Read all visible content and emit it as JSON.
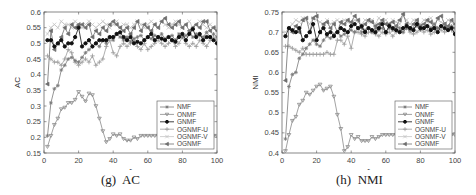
{
  "chart_data": [
    {
      "type": "line",
      "panel": "left",
      "caption": "(g)  AC",
      "title": "",
      "xlabel": "r",
      "ylabel": "AC",
      "xlim": [
        0,
        100
      ],
      "ylim": [
        0.15,
        0.6
      ],
      "xticks": [
        0,
        20,
        40,
        60,
        80,
        100
      ],
      "yticks": [
        0.15,
        0.2,
        0.25,
        0.3,
        0.35,
        0.4,
        0.45,
        0.5,
        0.55,
        0.6
      ],
      "ytick_labels": [
        "0.15",
        "0.2",
        "0.25",
        "0.3",
        "0.35",
        "0.4",
        "0.45",
        "0.5",
        "0.55",
        "0.6"
      ],
      "grid": false,
      "legend_position": "lower right",
      "x": [
        2,
        4,
        6,
        8,
        10,
        12,
        14,
        16,
        18,
        20,
        22,
        24,
        26,
        28,
        30,
        32,
        34,
        36,
        38,
        40,
        42,
        44,
        46,
        48,
        50,
        52,
        54,
        56,
        58,
        60,
        62,
        64,
        66,
        68,
        70,
        72,
        74,
        76,
        78,
        80,
        82,
        84,
        86,
        88,
        90,
        92,
        94,
        96,
        98,
        100
      ],
      "series": [
        {
          "name": "NMF",
          "color": "#7a7a7a",
          "marker": "star",
          "values": [
            0.205,
            0.31,
            0.355,
            0.365,
            0.415,
            0.43,
            0.45,
            0.455,
            0.445,
            0.44,
            0.455,
            0.47,
            0.48,
            0.49,
            0.5,
            0.49,
            0.51,
            0.5,
            0.52,
            0.51,
            0.53,
            0.52,
            0.51,
            0.52,
            0.505,
            0.515,
            0.52,
            0.525,
            0.51,
            0.52,
            0.515,
            0.525,
            0.52,
            0.53,
            0.515,
            0.52,
            0.525,
            0.51,
            0.53,
            0.52,
            0.525,
            0.535,
            0.52,
            0.53,
            0.525,
            0.52,
            0.535,
            0.52,
            0.53,
            0.52
          ]
        },
        {
          "name": "ONMF",
          "color": "#8a8a8a",
          "marker": "triangle-down",
          "values": [
            0.17,
            0.205,
            0.24,
            0.26,
            0.29,
            0.295,
            0.31,
            0.31,
            0.32,
            0.345,
            0.33,
            0.315,
            0.34,
            0.335,
            0.3,
            0.26,
            0.22,
            0.185,
            0.195,
            0.21,
            0.205,
            0.21,
            0.195,
            0.19,
            0.19,
            0.2,
            0.195,
            0.205,
            0.205,
            0.205,
            0.205,
            0.205,
            0.205,
            0.205,
            0.205,
            0.205,
            0.205,
            0.205,
            0.205,
            0.205,
            0.205,
            0.205,
            0.205,
            0.205,
            0.205,
            0.205,
            0.205,
            0.205,
            0.205,
            0.205
          ]
        },
        {
          "name": "GNMF",
          "color": "#111111",
          "marker": "circle",
          "values": [
            0.51,
            0.51,
            0.49,
            0.5,
            0.51,
            0.49,
            0.5,
            0.5,
            0.52,
            0.55,
            0.49,
            0.5,
            0.51,
            0.49,
            0.5,
            0.51,
            0.51,
            0.51,
            0.52,
            0.52,
            0.53,
            0.535,
            0.52,
            0.51,
            0.52,
            0.5,
            0.505,
            0.5,
            0.51,
            0.52,
            0.53,
            0.51,
            0.52,
            0.515,
            0.51,
            0.52,
            0.51,
            0.505,
            0.52,
            0.53,
            0.51,
            0.53,
            0.545,
            0.52,
            0.53,
            0.51,
            0.52,
            0.52,
            0.51,
            0.5
          ]
        },
        {
          "name": "OGNMF-U",
          "color": "#9a9a9a",
          "marker": "plus",
          "values": [
            0.46,
            0.45,
            0.44,
            0.44,
            0.43,
            0.45,
            0.48,
            0.47,
            0.44,
            0.43,
            0.44,
            0.45,
            0.44,
            0.46,
            0.43,
            0.44,
            0.45,
            0.49,
            0.51,
            0.47,
            0.46,
            0.49,
            0.5,
            0.49,
            0.5,
            0.51,
            0.49,
            0.48,
            0.5,
            0.48,
            0.49,
            0.5,
            0.51,
            0.5,
            0.49,
            0.5,
            0.51,
            0.49,
            0.5,
            0.52,
            0.5,
            0.49,
            0.5,
            0.49,
            0.51,
            0.5,
            0.49,
            0.51,
            0.52,
            0.51
          ]
        },
        {
          "name": "OGNMF-V",
          "color": "#c4c4c4",
          "marker": "x",
          "values": [
            0.53,
            0.55,
            0.56,
            0.55,
            0.57,
            0.56,
            0.56,
            0.55,
            0.57,
            0.56,
            0.55,
            0.56,
            0.57,
            0.56,
            0.55,
            0.56,
            0.57,
            0.56,
            0.55,
            0.56,
            0.57,
            0.55,
            0.56,
            0.56,
            0.55,
            0.56,
            0.57,
            0.56,
            0.55,
            0.56,
            0.57,
            0.56,
            0.55,
            0.57,
            0.56,
            0.55,
            0.56,
            0.57,
            0.56,
            0.55,
            0.56,
            0.57,
            0.55,
            0.56,
            0.57,
            0.56,
            0.55,
            0.56,
            0.55,
            0.55
          ]
        },
        {
          "name": "OGNMF",
          "color": "#6e6e6e",
          "marker": "triangle-left",
          "values": [
            0.37,
            0.54,
            0.48,
            0.5,
            0.52,
            0.55,
            0.53,
            0.56,
            0.55,
            0.56,
            0.56,
            0.55,
            0.56,
            0.52,
            0.54,
            0.53,
            0.55,
            0.54,
            0.56,
            0.57,
            0.56,
            0.55,
            0.54,
            0.55,
            0.53,
            0.55,
            0.57,
            0.54,
            0.56,
            0.55,
            0.54,
            0.56,
            0.55,
            0.57,
            0.58,
            0.56,
            0.55,
            0.56,
            0.57,
            0.55,
            0.56,
            0.54,
            0.55,
            0.56,
            0.55,
            0.57,
            0.57,
            0.54,
            0.55,
            0.54
          ]
        }
      ]
    },
    {
      "type": "line",
      "panel": "right",
      "caption": "(h)  NMI",
      "title": "",
      "xlabel": "r",
      "ylabel": "NMI",
      "xlim": [
        0,
        100
      ],
      "ylim": [
        0.4,
        0.75
      ],
      "xticks": [
        0,
        20,
        40,
        60,
        80,
        100
      ],
      "yticks": [
        0.4,
        0.45,
        0.5,
        0.55,
        0.6,
        0.65,
        0.7,
        0.75
      ],
      "ytick_labels": [
        "0.4",
        "0.45",
        "0.5",
        "0.55",
        "0.6",
        "0.65",
        "0.7",
        "0.75"
      ],
      "grid": false,
      "legend_position": "lower right",
      "x": [
        2,
        4,
        6,
        8,
        10,
        12,
        14,
        16,
        18,
        20,
        22,
        24,
        26,
        28,
        30,
        32,
        34,
        36,
        38,
        40,
        42,
        44,
        46,
        48,
        50,
        52,
        54,
        56,
        58,
        60,
        62,
        64,
        66,
        68,
        70,
        72,
        74,
        76,
        78,
        80,
        82,
        84,
        86,
        88,
        90,
        92,
        94,
        96,
        98,
        100
      ],
      "series": [
        {
          "name": "NMF",
          "color": "#7a7a7a",
          "marker": "star",
          "values": [
            0.435,
            0.565,
            0.595,
            0.6,
            0.635,
            0.645,
            0.66,
            0.67,
            0.68,
            0.67,
            0.665,
            0.68,
            0.69,
            0.685,
            0.695,
            0.7,
            0.69,
            0.695,
            0.7,
            0.705,
            0.7,
            0.71,
            0.7,
            0.705,
            0.71,
            0.7,
            0.71,
            0.705,
            0.71,
            0.7,
            0.71,
            0.705,
            0.715,
            0.71,
            0.7,
            0.71,
            0.705,
            0.71,
            0.715,
            0.705,
            0.71,
            0.715,
            0.71,
            0.72,
            0.71,
            0.715,
            0.72,
            0.71,
            0.715,
            0.71
          ]
        },
        {
          "name": "ONMF",
          "color": "#8a8a8a",
          "marker": "triangle-down",
          "values": [
            0.405,
            0.445,
            0.48,
            0.49,
            0.52,
            0.53,
            0.55,
            0.545,
            0.555,
            0.565,
            0.57,
            0.555,
            0.56,
            0.565,
            0.54,
            0.495,
            0.46,
            0.405,
            0.415,
            0.445,
            0.435,
            0.44,
            0.43,
            0.43,
            0.43,
            0.44,
            0.435,
            0.44,
            0.445,
            0.445,
            0.445,
            0.445,
            0.445,
            0.445,
            0.445,
            0.445,
            0.445,
            0.445,
            0.445,
            0.445,
            0.445,
            0.445,
            0.445,
            0.445,
            0.445,
            0.445,
            0.445,
            0.445,
            0.445,
            0.445
          ]
        },
        {
          "name": "GNMF",
          "color": "#111111",
          "marker": "circle",
          "values": [
            0.69,
            0.71,
            0.705,
            0.7,
            0.71,
            0.68,
            0.69,
            0.7,
            0.72,
            0.68,
            0.7,
            0.71,
            0.695,
            0.7,
            0.69,
            0.7,
            0.71,
            0.705,
            0.7,
            0.715,
            0.72,
            0.71,
            0.715,
            0.7,
            0.71,
            0.705,
            0.7,
            0.71,
            0.72,
            0.7,
            0.715,
            0.71,
            0.705,
            0.7,
            0.71,
            0.715,
            0.71,
            0.705,
            0.72,
            0.71,
            0.71,
            0.715,
            0.705,
            0.71,
            0.7,
            0.715,
            0.71,
            0.705,
            0.71,
            0.695
          ]
        },
        {
          "name": "OGNMF-U",
          "color": "#9a9a9a",
          "marker": "plus",
          "values": [
            0.665,
            0.665,
            0.66,
            0.655,
            0.65,
            0.66,
            0.645,
            0.645,
            0.645,
            0.645,
            0.645,
            0.645,
            0.65,
            0.645,
            0.645,
            0.68,
            0.68,
            0.67,
            0.69,
            0.66,
            0.7,
            0.7,
            0.695,
            0.69,
            0.7,
            0.7,
            0.695,
            0.69,
            0.7,
            0.695,
            0.7,
            0.69,
            0.7,
            0.705,
            0.7,
            0.71,
            0.7,
            0.695,
            0.7,
            0.71,
            0.7,
            0.705,
            0.695,
            0.7,
            0.71,
            0.705,
            0.7,
            0.71,
            0.705,
            0.7
          ]
        },
        {
          "name": "OGNMF-V",
          "color": "#c4c4c4",
          "marker": "x",
          "values": [
            0.7,
            0.71,
            0.72,
            0.73,
            0.725,
            0.735,
            0.73,
            0.72,
            0.735,
            0.73,
            0.725,
            0.72,
            0.73,
            0.72,
            0.725,
            0.73,
            0.72,
            0.73,
            0.725,
            0.72,
            0.73,
            0.725,
            0.72,
            0.73,
            0.725,
            0.73,
            0.72,
            0.735,
            0.725,
            0.73,
            0.72,
            0.73,
            0.725,
            0.72,
            0.74,
            0.73,
            0.72,
            0.73,
            0.725,
            0.72,
            0.73,
            0.725,
            0.735,
            0.72,
            0.73,
            0.725,
            0.72,
            0.73,
            0.725,
            0.72
          ]
        },
        {
          "name": "OGNMF",
          "color": "#6e6e6e",
          "marker": "triangle-left",
          "values": [
            0.58,
            0.71,
            0.7,
            0.715,
            0.7,
            0.73,
            0.735,
            0.7,
            0.735,
            0.74,
            0.7,
            0.72,
            0.725,
            0.71,
            0.72,
            0.7,
            0.725,
            0.72,
            0.73,
            0.725,
            0.74,
            0.73,
            0.71,
            0.72,
            0.73,
            0.725,
            0.715,
            0.72,
            0.73,
            0.72,
            0.72,
            0.725,
            0.715,
            0.73,
            0.745,
            0.72,
            0.71,
            0.72,
            0.73,
            0.715,
            0.72,
            0.73,
            0.725,
            0.71,
            0.735,
            0.74,
            0.72,
            0.715,
            0.73,
            0.72
          ]
        }
      ]
    }
  ]
}
